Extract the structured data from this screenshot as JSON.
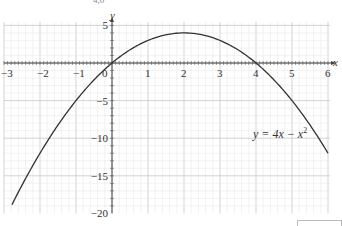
{
  "chart_data": {
    "type": "line",
    "title": "",
    "function": "y = 4x - x^2",
    "xlabel": "x",
    "ylabel": "y",
    "xlim": [
      -3,
      6
    ],
    "ylim": [
      -20,
      5
    ],
    "grid": true,
    "x_ticks": [
      -3,
      -2,
      -1,
      0,
      1,
      2,
      3,
      4,
      5,
      6
    ],
    "y_ticks": [
      5,
      -5,
      -10,
      -15,
      -20
    ],
    "x_tick_labels": [
      "−3",
      "−2",
      "−1",
      "0",
      "1",
      "2",
      "3",
      "4",
      "5",
      "6"
    ],
    "y_tick_labels": [
      "5",
      "−5",
      "−10",
      "−15",
      "−20"
    ],
    "series": [
      {
        "name": "y = 4x − x²",
        "x": [
          -2.78,
          -2.5,
          -2,
          -1.5,
          -1,
          -0.5,
          0,
          0.5,
          1,
          1.5,
          2,
          2.5,
          3,
          3.5,
          4,
          4.5,
          5,
          5.5,
          6
        ],
        "y": [
          -18.85,
          -16.25,
          -12,
          -8.25,
          -5,
          -2.25,
          0,
          1.75,
          3,
          3.75,
          4,
          3.75,
          3,
          1.75,
          0,
          -2.25,
          -5,
          -8.25,
          -12
        ]
      }
    ],
    "annotations": [
      {
        "text": "y = 4x − x²",
        "x": 4.9,
        "y": -10
      }
    ],
    "legend": "none"
  },
  "labels": {
    "equation_prefix": "y = 4x − x",
    "equation_exp": "2",
    "x_axis_name": "x",
    "y_axis_name": "y",
    "top_clipped_text": "4,0"
  }
}
